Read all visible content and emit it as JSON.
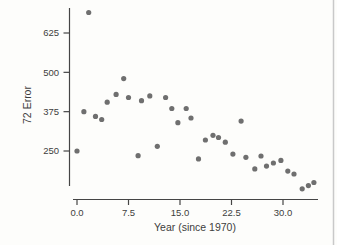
{
  "page": {
    "background": "#fdfdfb",
    "edge_line_color": "#c9c9c9"
  },
  "chart_data": {
    "type": "scatter",
    "title": "",
    "xlabel": "Year (since 1970)",
    "ylabel": "72 Error",
    "x_ticks": [
      0,
      7.5,
      15,
      22.5,
      30
    ],
    "x_tick_labels": [
      "0.0",
      "7.5",
      "15.0",
      "22.5",
      "30.0"
    ],
    "y_ticks": [
      250,
      375,
      500,
      625
    ],
    "y_tick_labels": [
      "250",
      "375",
      "500",
      "625"
    ],
    "xlim": [
      -1,
      36
    ],
    "ylim": [
      110,
      705
    ],
    "grid": false,
    "legend": null,
    "point_color": "#6f6f6f",
    "axis_color": "#454545",
    "point_radius": 2.6,
    "points": [
      [
        0,
        250
      ],
      [
        1,
        375
      ],
      [
        1.7,
        690
      ],
      [
        2.7,
        360
      ],
      [
        3.6,
        350
      ],
      [
        4.4,
        405
      ],
      [
        5.7,
        430
      ],
      [
        6.8,
        480
      ],
      [
        7.5,
        420
      ],
      [
        8.9,
        235
      ],
      [
        9.4,
        410
      ],
      [
        10.6,
        425
      ],
      [
        11.7,
        265
      ],
      [
        12.9,
        420
      ],
      [
        13.8,
        385
      ],
      [
        14.7,
        340
      ],
      [
        15.9,
        385
      ],
      [
        16.6,
        355
      ],
      [
        17.7,
        225
      ],
      [
        18.7,
        285
      ],
      [
        19.8,
        300
      ],
      [
        20.6,
        293
      ],
      [
        21.6,
        278
      ],
      [
        22.7,
        240
      ],
      [
        23.9,
        345
      ],
      [
        24.6,
        230
      ],
      [
        25.9,
        193
      ],
      [
        26.8,
        234
      ],
      [
        27.6,
        202
      ],
      [
        28.6,
        212
      ],
      [
        29.7,
        220
      ],
      [
        30.7,
        186
      ],
      [
        31.6,
        177
      ],
      [
        32.8,
        130
      ],
      [
        33.7,
        140
      ],
      [
        34.5,
        150
      ]
    ]
  }
}
